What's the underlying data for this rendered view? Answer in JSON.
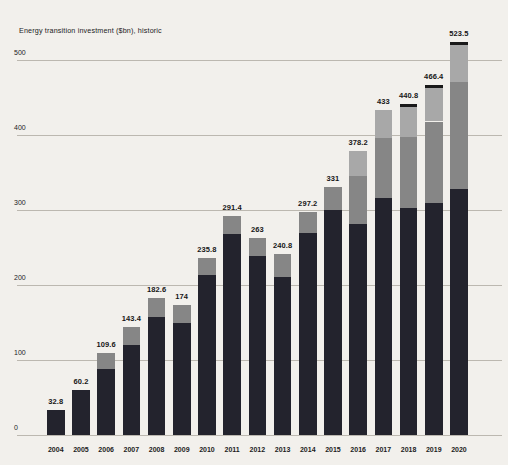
{
  "title": "Energy transition investment ($bn), historic",
  "colors": {
    "background": "#f2f0ec",
    "bar_dark": "#23232d",
    "bar_medium_gray": "#868686",
    "bar_light_gray": "#a8a8a8",
    "bar_cap": "#191919",
    "gridline": "#bcb8b0",
    "text": "#1c1c1c"
  },
  "chart_data": {
    "type": "bar",
    "stacked": true,
    "title": "Energy transition investment ($bn), historic",
    "xlabel": "",
    "ylabel": "$bn",
    "grid": true,
    "legend": "none",
    "ylim": [
      0,
      530
    ],
    "yticks": [
      0,
      100,
      200,
      300,
      400,
      500
    ],
    "categories": [
      "2004",
      "2005",
      "2006",
      "2007",
      "2008",
      "2009",
      "2010",
      "2011",
      "2012",
      "2013",
      "2014",
      "2015",
      "2016",
      "2017",
      "2018",
      "2019",
      "2020"
    ],
    "totals": [
      32.8,
      60.2,
      109.6,
      143.4,
      182.6,
      174,
      235.8,
      291.4,
      263,
      240.8,
      297.2,
      331,
      378.2,
      433,
      440.8,
      466.4,
      523.5
    ],
    "total_labels": [
      "32.8",
      "60.2",
      "109.6",
      "143.4",
      "182.6",
      "174",
      "235.8",
      "291.4",
      "263",
      "240.8",
      "297.2",
      "331",
      "378.2",
      "433",
      "440.8",
      "466.4",
      "523.5"
    ],
    "series": [
      {
        "name": "segment-dark-bottom",
        "color": "#23232d",
        "values": [
          32.8,
          60.2,
          87.6,
          120.4,
          157.6,
          150.0,
          212.8,
          267.4,
          239.0,
          210.8,
          269.2,
          300.0,
          282.0,
          316.0,
          302.8,
          310.0,
          327.5
        ]
      },
      {
        "name": "segment-medium-gray",
        "color": "#868686",
        "values": [
          0,
          0,
          22.0,
          23.0,
          25.0,
          24.0,
          23.0,
          24.0,
          24.0,
          30.0,
          28.0,
          31.0,
          63.0,
          80.0,
          95.0,
          108.0,
          143.0
        ]
      },
      {
        "name": "segment-light-gray",
        "color": "#a8a8a8",
        "values": [
          0,
          0,
          0,
          0,
          0,
          0,
          0,
          0,
          0,
          0,
          0,
          0,
          33.2,
          37.0,
          40.0,
          44.4,
          49.0
        ]
      },
      {
        "name": "segment-dark-cap",
        "color": "#191919",
        "values": [
          0,
          0,
          0,
          0,
          0,
          0,
          0,
          0,
          0,
          0,
          0,
          0,
          0,
          0,
          3.0,
          4.0,
          4.0
        ]
      }
    ]
  }
}
